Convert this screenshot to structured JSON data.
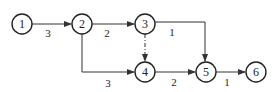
{
  "diagram": {
    "type": "activity-on-arrow network",
    "nodes": [
      {
        "id": "1",
        "label": "1",
        "x": 22,
        "y": 24
      },
      {
        "id": "2",
        "label": "2",
        "x": 82,
        "y": 24
      },
      {
        "id": "3",
        "label": "3",
        "x": 145,
        "y": 24
      },
      {
        "id": "4",
        "label": "4",
        "x": 145,
        "y": 72
      },
      {
        "id": "5",
        "label": "5",
        "x": 206,
        "y": 72
      },
      {
        "id": "6",
        "label": "6",
        "x": 256,
        "y": 72
      }
    ],
    "edges": [
      {
        "from": "1",
        "to": "2",
        "label": "3",
        "style": "solid"
      },
      {
        "from": "2",
        "to": "3",
        "label": "2",
        "style": "solid"
      },
      {
        "from": "2",
        "to": "4",
        "label": "3",
        "style": "solid",
        "route": "down-then-right"
      },
      {
        "from": "3",
        "to": "4",
        "label": "",
        "style": "dummy-dashed"
      },
      {
        "from": "3",
        "to": "5",
        "label": "1",
        "style": "solid",
        "route": "right-then-down"
      },
      {
        "from": "4",
        "to": "5",
        "label": "2",
        "style": "solid"
      },
      {
        "from": "5",
        "to": "6",
        "label": "1",
        "style": "solid"
      }
    ]
  },
  "labels": {
    "n1": "1",
    "n2": "2",
    "n3": "3",
    "n4": "4",
    "n5": "5",
    "n6": "6",
    "e12": "3",
    "e23": "2",
    "e24": "3",
    "e35": "1",
    "e45": "2",
    "e56": "1"
  }
}
